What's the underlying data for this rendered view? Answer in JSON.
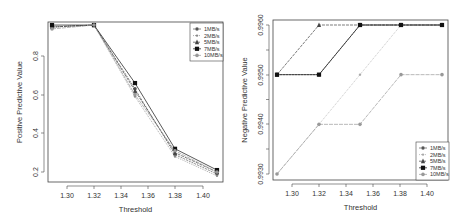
{
  "chart_data": [
    {
      "type": "line",
      "title": "",
      "xlabel": "Threshold",
      "ylabel": "Positive Predictive Value",
      "x": [
        1.29,
        1.32,
        1.35,
        1.38,
        1.41
      ],
      "x_ticks": [
        "1.30",
        "1.32",
        "1.34",
        "1.36",
        "1.38",
        "1.40"
      ],
      "y_ticks": [
        "0.2",
        "0.4",
        "0.6",
        "0.8"
      ],
      "xlim": [
        1.285,
        1.415
      ],
      "ylim": [
        0.17,
        0.97
      ],
      "grid": false,
      "legend_position": "topright",
      "series": [
        {
          "name": "1MB/s",
          "values": [
            0.95,
            0.96,
            0.63,
            0.29,
            0.19
          ],
          "marker": "circle",
          "dash": "2,1",
          "color": "#555555"
        },
        {
          "name": "2MB/s",
          "values": [
            0.95,
            0.96,
            0.59,
            0.28,
            0.18
          ],
          "marker": "dot",
          "dash": "1,1",
          "color": "#888888"
        },
        {
          "name": "5MB/s",
          "values": [
            0.95,
            0.96,
            0.62,
            0.3,
            0.2
          ],
          "marker": "triangle",
          "dash": "3,1",
          "color": "#444444"
        },
        {
          "name": "7MB/s",
          "values": [
            0.96,
            0.96,
            0.66,
            0.32,
            0.21
          ],
          "marker": "square",
          "dash": "",
          "color": "#111111"
        },
        {
          "name": "10MB/s",
          "values": [
            0.94,
            0.96,
            0.6,
            0.31,
            0.2
          ],
          "marker": "circle",
          "dash": "4,1",
          "color": "#999999"
        }
      ]
    },
    {
      "type": "line",
      "title": "",
      "xlabel": "Threshold",
      "ylabel": "Negative Predictive Value",
      "x": [
        1.29,
        1.32,
        1.35,
        1.38,
        1.41
      ],
      "x_ticks": [
        "1.30",
        "1.32",
        "1.34",
        "1.36",
        "1.38",
        "1.40"
      ],
      "y_ticks": [
        "0.9930",
        "0.9940",
        "0.9950",
        "0.9960"
      ],
      "xlim": [
        1.285,
        1.415
      ],
      "ylim": [
        0.99287,
        0.99603
      ],
      "grid": false,
      "legend_position": "bottomright",
      "series": [
        {
          "name": "1MB/s",
          "values": [
            0.995,
            0.995,
            0.996,
            0.996,
            0.996
          ],
          "marker": "circle",
          "dash": "2,1",
          "color": "#555555"
        },
        {
          "name": "2MB/s",
          "values": [
            0.993,
            0.994,
            0.995,
            0.996,
            0.996
          ],
          "marker": "dot",
          "dash": "1,1",
          "color": "#aaaaaa"
        },
        {
          "name": "5MB/s",
          "values": [
            0.995,
            0.996,
            0.996,
            0.996,
            0.996
          ],
          "marker": "triangle",
          "dash": "3,1",
          "color": "#444444"
        },
        {
          "name": "7MB/s",
          "values": [
            0.995,
            0.995,
            0.996,
            0.996,
            0.996
          ],
          "marker": "square",
          "dash": "",
          "color": "#111111"
        },
        {
          "name": "10MB/s",
          "values": [
            0.993,
            0.994,
            0.994,
            0.995,
            0.995
          ],
          "marker": "circle",
          "dash": "4,1",
          "color": "#999999"
        }
      ]
    }
  ]
}
